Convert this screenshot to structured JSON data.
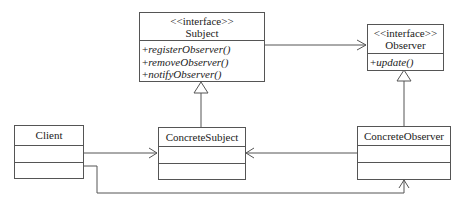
{
  "diagram": {
    "type": "UML class diagram",
    "pattern": "Observer",
    "classes": {
      "subject": {
        "stereotype": "<<interface>>",
        "name": "Subject",
        "operations": [
          "registerObserver()",
          "removeObserver()",
          "notifyObserver()"
        ],
        "visibility": "+"
      },
      "observer": {
        "stereotype": "<<interface>>",
        "name": "Observer",
        "operations": [
          "update()"
        ],
        "visibility": "+"
      },
      "client": {
        "name": "Client"
      },
      "concrete_subject": {
        "name": "ConcreteSubject"
      },
      "concrete_observer": {
        "name": "ConcreteObserver"
      }
    },
    "relationships": [
      {
        "from": "Subject",
        "to": "Observer",
        "type": "association"
      },
      {
        "from": "ConcreteSubject",
        "to": "Subject",
        "type": "realization"
      },
      {
        "from": "ConcreteObserver",
        "to": "Observer",
        "type": "realization"
      },
      {
        "from": "Client",
        "to": "ConcreteSubject",
        "type": "association"
      },
      {
        "from": "Client",
        "to": "ConcreteObserver",
        "type": "association"
      },
      {
        "from": "ConcreteObserver",
        "to": "ConcreteSubject",
        "type": "association"
      }
    ],
    "line_color": "#555555"
  }
}
